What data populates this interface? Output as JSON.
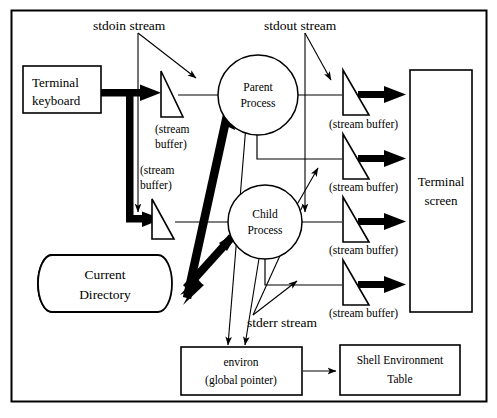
{
  "diagram": {
    "stroke_color": "#000000",
    "background_color": "#ffffff",
    "stream_labels": {
      "stdin": "stdoin stream",
      "stdout": "stdout stream",
      "stderr": "stderr stream"
    },
    "nodes": {
      "terminal_keyboard": {
        "line1": "Terminal",
        "line2": "keyboard"
      },
      "terminal_screen": {
        "line1": "Terminal",
        "line2": "screen"
      },
      "parent_process": {
        "line1": "Parent",
        "line2": "Process"
      },
      "child_process": {
        "line1": "Child",
        "line2": "Process"
      },
      "current_directory": {
        "line1": "Current",
        "line2": "Directory"
      },
      "environ": {
        "line1": "environ",
        "line2": "(global pointer)"
      },
      "shell_env_table": {
        "line1": "Shell Environment",
        "line2": "Table"
      }
    },
    "buffers": [
      {
        "id": "parent-stdin-buffer",
        "line1": "(stream",
        "line2": "buffer)",
        "inline": "(stream buffer)"
      },
      {
        "id": "child-stdin-buffer",
        "line1": "(stream",
        "line2": "buffer)",
        "inline": "(stream buffer)"
      },
      {
        "id": "parent-stdout-buffer",
        "inline": "(stream buffer)"
      },
      {
        "id": "parent-stderr-buffer",
        "inline": "(stream buffer)"
      },
      {
        "id": "child-stdout-buffer",
        "inline": "(stream buffer)"
      },
      {
        "id": "child-stderr-buffer",
        "inline": "(stream buffer)"
      }
    ]
  }
}
